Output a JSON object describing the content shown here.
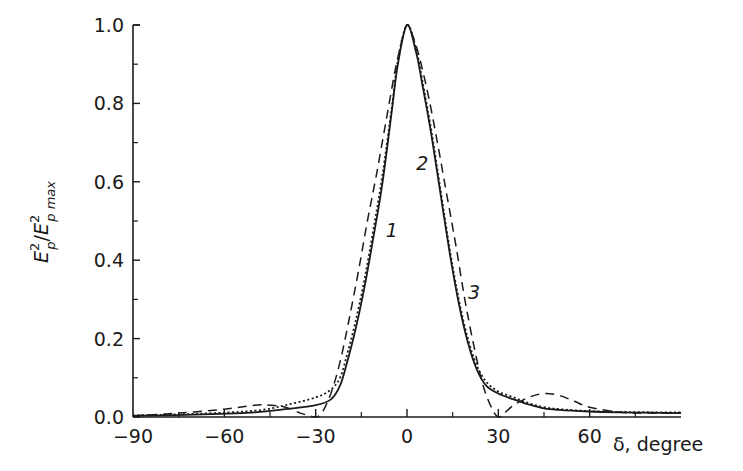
{
  "chart_data": {
    "type": "line",
    "title": "",
    "xlabel": "δ, degree",
    "ylabel": "E_p^2/E_p max^2",
    "xlim": [
      -90,
      90
    ],
    "ylim": [
      0,
      1.0
    ],
    "x_ticks": [
      -90,
      -60,
      -30,
      0,
      30,
      60
    ],
    "x_tick_labels": [
      "−90",
      "−60",
      "−30",
      "0",
      "30",
      "60"
    ],
    "x_minor_ticks": [
      -75,
      -45,
      -15,
      15,
      45,
      75
    ],
    "y_ticks": [
      0.0,
      0.2,
      0.4,
      0.6,
      0.8,
      1.0
    ],
    "y_tick_labels": [
      "0.0",
      "0.2",
      "0.4",
      "0.6",
      "0.8",
      "1.0"
    ],
    "y_minor_ticks": [
      0.1,
      0.3,
      0.5,
      0.7,
      0.9
    ],
    "grid": false,
    "legend": "inline curve labels 1, 2, 3",
    "series": [
      {
        "name": "1",
        "style": "solid",
        "x": [
          -90,
          -70,
          -50,
          -40,
          -30,
          -25,
          -22,
          -20,
          -17,
          -14,
          -11,
          -8,
          -5,
          -3,
          0,
          3,
          5,
          8,
          11,
          14,
          17,
          20,
          23,
          26,
          30,
          35,
          40,
          45,
          50,
          60,
          70,
          80,
          90
        ],
        "y": [
          0.003,
          0.006,
          0.012,
          0.02,
          0.03,
          0.045,
          0.08,
          0.13,
          0.22,
          0.33,
          0.46,
          0.6,
          0.78,
          0.9,
          1.0,
          0.93,
          0.85,
          0.72,
          0.57,
          0.42,
          0.29,
          0.19,
          0.12,
          0.08,
          0.06,
          0.045,
          0.032,
          0.022,
          0.018,
          0.014,
          0.012,
          0.011,
          0.01
        ]
      },
      {
        "name": "2",
        "style": "dotted",
        "x": [
          -90,
          -70,
          -50,
          -40,
          -30,
          -25,
          -22,
          -20,
          -17,
          -14,
          -11,
          -8,
          -5,
          -3,
          0,
          3,
          5,
          8,
          11,
          14,
          17,
          20,
          23,
          26,
          30,
          35,
          40,
          45,
          50,
          60,
          70,
          80,
          90
        ],
        "y": [
          0.004,
          0.008,
          0.016,
          0.03,
          0.05,
          0.07,
          0.1,
          0.15,
          0.24,
          0.35,
          0.48,
          0.62,
          0.79,
          0.91,
          1.0,
          0.94,
          0.86,
          0.73,
          0.58,
          0.43,
          0.3,
          0.2,
          0.13,
          0.09,
          0.065,
          0.05,
          0.035,
          0.025,
          0.02,
          0.015,
          0.013,
          0.012,
          0.012
        ]
      },
      {
        "name": "3",
        "style": "dashed",
        "x": [
          -90,
          -75,
          -60,
          -50,
          -45,
          -40,
          -35,
          -32,
          -30,
          -28,
          -25,
          -22,
          -19,
          -16,
          -13,
          -10,
          -7,
          -4,
          -2,
          0,
          2,
          4,
          7,
          10,
          13,
          16,
          19,
          22,
          25,
          28,
          30,
          32,
          35,
          40,
          45,
          50,
          55,
          60,
          70,
          80,
          90
        ],
        "y": [
          0.003,
          0.01,
          0.02,
          0.03,
          0.03,
          0.025,
          0.01,
          0.003,
          0.0,
          0.01,
          0.06,
          0.14,
          0.25,
          0.37,
          0.5,
          0.62,
          0.75,
          0.88,
          0.95,
          1.0,
          0.97,
          0.92,
          0.82,
          0.7,
          0.57,
          0.44,
          0.3,
          0.18,
          0.08,
          0.02,
          0.0,
          0.01,
          0.03,
          0.05,
          0.06,
          0.055,
          0.04,
          0.025,
          0.012,
          0.01,
          0.01
        ]
      }
    ],
    "curve_labels": [
      {
        "text": "1",
        "x": -7,
        "y": 0.46
      },
      {
        "text": "2",
        "x": 3,
        "y": 0.63
      },
      {
        "text": "3",
        "x": 20,
        "y": 0.3
      }
    ]
  }
}
